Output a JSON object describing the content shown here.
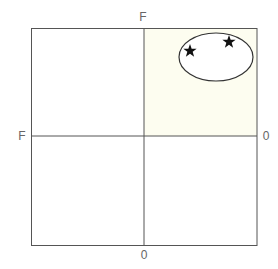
{
  "diagram": {
    "type": "quadrant",
    "axis_labels": {
      "top": "F",
      "left": "F",
      "right": "0",
      "bottom": "0"
    },
    "highlighted_quadrant": "top-right",
    "colors": {
      "line": "#555555",
      "highlight_fill": "#fdfdf0",
      "ellipse_fill": "#ffffff",
      "star": "#111111",
      "label": "#666666"
    },
    "ellipse": {
      "cx": 216,
      "cy": 57,
      "rx": 37,
      "ry": 24,
      "markers": [
        {
          "icon": "star-icon",
          "x": 190,
          "y": 51
        },
        {
          "icon": "star-icon",
          "x": 229,
          "y": 42
        }
      ]
    }
  }
}
